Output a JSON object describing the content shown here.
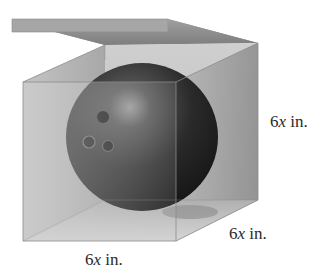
{
  "figure": {
    "labels": {
      "height": {
        "value": "6",
        "var": "x",
        "unit": " in."
      },
      "depth": {
        "value": "6",
        "var": "x",
        "unit": " in."
      },
      "width": {
        "value": "6",
        "var": "x",
        "unit": " in."
      }
    },
    "colors": {
      "box_face": "#b9b9b9",
      "box_edge": "#8a8a8a",
      "lid": "#9a9a9a",
      "ball_dark": "#1c1c1c",
      "ball_highlight": "#8e8e8e",
      "label_text": "#2a2a2a"
    }
  }
}
